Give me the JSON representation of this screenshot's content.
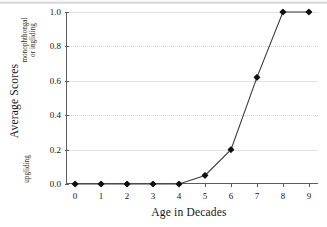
{
  "chart_data": {
    "type": "line",
    "title": "",
    "xlabel": "Age in Decades",
    "ylabel": "Average Scores",
    "ylabel_top": "monophthongal",
    "ylabel_top_line2": "or ingliding",
    "ylabel_bottom": "upgliding",
    "x": [
      0,
      1,
      2,
      3,
      4,
      5,
      6,
      7,
      8,
      9
    ],
    "values": [
      0.0,
      0.0,
      0.0,
      0.0,
      0.0,
      0.05,
      0.2,
      0.62,
      1.0,
      1.0
    ],
    "series": [
      {
        "name": "Average Scores",
        "values": [
          0.0,
          0.0,
          0.0,
          0.0,
          0.0,
          0.05,
          0.2,
          0.62,
          1.0,
          1.0
        ]
      }
    ],
    "xtick_labels": [
      "0",
      "1",
      "2",
      "3",
      "4",
      "5",
      "6",
      "7",
      "8",
      "9"
    ],
    "ytick_labels": [
      "0.0",
      "0.2",
      "0.4",
      "0.6",
      "0.8",
      "1.0"
    ],
    "ytick_values": [
      0.0,
      0.2,
      0.4,
      0.6,
      0.8,
      1.0
    ],
    "xlim": [
      -0.35,
      9.35
    ],
    "ylim": [
      0.0,
      1.0
    ],
    "grid": "horizontal",
    "legend": "none",
    "marker": "filled-diamond",
    "line_color": "#3a3a3a",
    "marker_color": "#111111",
    "grid_color": "#e2e2e2",
    "axis_color": "#5c5c5c"
  }
}
